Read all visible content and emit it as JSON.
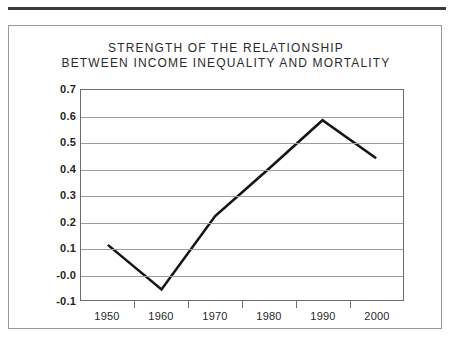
{
  "chart_data": {
    "type": "line",
    "title": "STRENGTH OF THE RELATIONSHIP BETWEEN INCOME INEQUALITY AND MORTALITY",
    "title_lines": [
      "STRENGTH OF THE RELATIONSHIP",
      "BETWEEN INCOME INEQUALITY AND MORTALITY"
    ],
    "xlabel": "",
    "ylabel": "",
    "x": [
      1950,
      1960,
      1970,
      1980,
      1990,
      2000
    ],
    "values": [
      0.11,
      -0.06,
      0.22,
      0.4,
      0.585,
      0.44
    ],
    "xtick_labels": [
      "1950",
      "1960",
      "1970",
      "1980",
      "1990",
      "2000"
    ],
    "ytick_labels": [
      "0.7",
      "0.6",
      "0.5",
      "0.4",
      "0.3",
      "0.2",
      "0.1",
      "-0.0",
      "-0.1"
    ],
    "ytick_values": [
      0.7,
      0.6,
      0.5,
      0.4,
      0.3,
      0.2,
      0.1,
      0.0,
      -0.1
    ],
    "ylim": [
      -0.1,
      0.7
    ],
    "xlim": [
      1945,
      2005
    ],
    "grid": true,
    "legend": false,
    "line_color": "#151515",
    "grid_color": "#9d9d9d",
    "frame_color": "#6e6e6e",
    "background": "#ffffff"
  }
}
